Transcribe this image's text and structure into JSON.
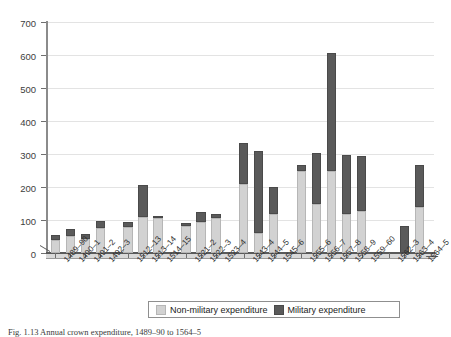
{
  "figure": {
    "caption": "Fig. 1.13 Annual crown expenditure, 1489–90 to 1564–5"
  },
  "chart_data": {
    "type": "bar",
    "subtype": "stacked-column",
    "title": "",
    "xlabel": "",
    "ylabel": "",
    "ylim": [
      0,
      700
    ],
    "ytick_step": 100,
    "yticks": [
      "0",
      "100",
      "200",
      "300",
      "400",
      "500",
      "600",
      "700"
    ],
    "grid": true,
    "legend_position": "bottom",
    "categories": [
      "1489–90",
      "1490–1",
      "1491–2",
      "1492–3",
      "1512–13",
      "1513–14",
      "1514–15",
      "1521–2",
      "1522–3",
      "1523–4",
      "1543–4",
      "1544–5",
      "1545–6",
      "1555–6",
      "1556–7",
      "1557–8",
      "1558–9",
      "1559–60",
      "1562–3",
      "1563–4",
      "1564–5"
    ],
    "category_gaps_after": [
      3,
      6,
      9,
      12,
      17
    ],
    "series": [
      {
        "name": "Non-military expenditure",
        "color": "#d2d2d2",
        "values": [
          38,
          52,
          42,
          75,
          80,
          108,
          105,
          82,
          95,
          105,
          210,
          62,
          118,
          248,
          148,
          250,
          118,
          128,
          0,
          0,
          140
        ]
      },
      {
        "name": "Military expenditure",
        "color": "#5a5a5a",
        "values": [
          17,
          20,
          15,
          22,
          15,
          97,
          5,
          10,
          28,
          13,
          122,
          248,
          82,
          18,
          155,
          355,
          178,
          165,
          0,
          82,
          128
        ]
      }
    ],
    "totals": [
      55,
      72,
      57,
      97,
      95,
      205,
      110,
      92,
      123,
      118,
      332,
      310,
      200,
      266,
      303,
      605,
      296,
      293,
      0,
      82,
      268
    ],
    "annotations": []
  },
  "legend": {
    "items": [
      {
        "label": "Non-military expenditure",
        "swatch": "light-grey-swatch"
      },
      {
        "label": "Military expenditure",
        "swatch": "dark-grey-swatch"
      }
    ]
  }
}
